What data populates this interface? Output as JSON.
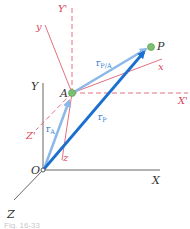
{
  "diagram": {
    "fixed_axes": {
      "X": "X",
      "Y": "Y",
      "Z": "Z",
      "origin": "O"
    },
    "translating_axes": {
      "X": "X'",
      "Y": "Y'",
      "Z": "Z'"
    },
    "rotating_axes": {
      "x": "x",
      "y": "y",
      "z": "z"
    },
    "points": {
      "A": "A",
      "P": "P"
    },
    "vectors": {
      "rA": "r",
      "rA_sub": "A",
      "rP": "r",
      "rP_sub": "P",
      "rPA": "r",
      "rPA_sub": "P/A"
    },
    "caption": "Fig. 16-33"
  },
  "colors": {
    "fixed_axis": "#555555",
    "moving_axis": "#e06070",
    "vector_light": "#8ab8ea",
    "vector_dark": "#1a6fd0",
    "point": "#7ac070"
  }
}
